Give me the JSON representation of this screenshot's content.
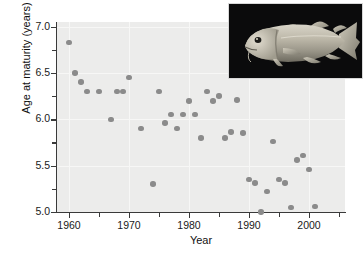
{
  "chart_data": {
    "type": "scatter",
    "title": "",
    "xlabel": "Year",
    "ylabel": "Age at maturity (years)",
    "xlim": [
      1958,
      2006
    ],
    "ylim": [
      5.0,
      7.05
    ],
    "xticks": [
      1960,
      1970,
      1980,
      1990,
      2000
    ],
    "xticklabels": [
      "1960",
      "1970",
      "1980",
      "1990",
      "2000"
    ],
    "xticks_minor": [
      1965,
      1975,
      1985,
      1995,
      2005
    ],
    "yticks": [
      5.0,
      5.5,
      6.0,
      6.5,
      7.0
    ],
    "yticklabels": [
      "5.0",
      "5.5",
      "6.0",
      "6.5",
      "7.0"
    ],
    "yticks_minor": [
      5.25,
      5.75,
      6.25,
      6.75
    ],
    "grid": true,
    "legend": "none",
    "marker": {
      "shape": "circle",
      "color": "#8b8b8b",
      "size": 5.6
    },
    "plot_background": "#ececeb",
    "points": [
      {
        "x": 1960,
        "y": 6.83
      },
      {
        "x": 1961,
        "y": 6.5
      },
      {
        "x": 1962,
        "y": 6.4
      },
      {
        "x": 1963,
        "y": 6.3
      },
      {
        "x": 1965,
        "y": 6.3
      },
      {
        "x": 1967,
        "y": 6.0
      },
      {
        "x": 1968,
        "y": 6.3
      },
      {
        "x": 1969,
        "y": 6.3
      },
      {
        "x": 1970,
        "y": 6.45
      },
      {
        "x": 1972,
        "y": 5.9
      },
      {
        "x": 1974,
        "y": 5.3
      },
      {
        "x": 1975,
        "y": 6.3
      },
      {
        "x": 1976,
        "y": 5.96
      },
      {
        "x": 1977,
        "y": 6.05
      },
      {
        "x": 1978,
        "y": 5.9
      },
      {
        "x": 1979,
        "y": 6.05
      },
      {
        "x": 1980,
        "y": 6.2
      },
      {
        "x": 1981,
        "y": 6.05
      },
      {
        "x": 1982,
        "y": 5.8
      },
      {
        "x": 1983,
        "y": 6.3
      },
      {
        "x": 1984,
        "y": 6.2
      },
      {
        "x": 1985,
        "y": 6.25
      },
      {
        "x": 1986,
        "y": 5.8
      },
      {
        "x": 1987,
        "y": 5.86
      },
      {
        "x": 1988,
        "y": 6.21
      },
      {
        "x": 1989,
        "y": 5.85
      },
      {
        "x": 1990,
        "y": 5.35
      },
      {
        "x": 1991,
        "y": 5.31
      },
      {
        "x": 1992,
        "y": 5.0
      },
      {
        "x": 1993,
        "y": 5.22
      },
      {
        "x": 1994,
        "y": 5.76
      },
      {
        "x": 1995,
        "y": 5.35
      },
      {
        "x": 1996,
        "y": 5.31
      },
      {
        "x": 1997,
        "y": 5.05
      },
      {
        "x": 1998,
        "y": 5.56
      },
      {
        "x": 1999,
        "y": 5.61
      },
      {
        "x": 2000,
        "y": 5.46
      },
      {
        "x": 2001,
        "y": 5.06
      }
    ]
  },
  "inset": {
    "caption": "",
    "subject": "atlantic-cod-photo",
    "background": "#0b0b0c"
  }
}
